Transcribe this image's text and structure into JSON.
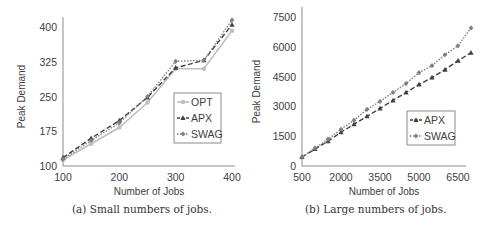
{
  "chart_data": [
    {
      "type": "line",
      "title": "",
      "caption": "(a) Small numbers of jobs.",
      "xlabel": "Number of Jobs",
      "ylabel": "Peak Demand",
      "x": [
        100,
        150,
        200,
        250,
        300,
        350,
        400
      ],
      "xticks": [
        "100",
        "200",
        "300",
        "400"
      ],
      "yticks": [
        "100",
        "175",
        "250",
        "325",
        "400"
      ],
      "xlim": [
        100,
        400
      ],
      "ylim": [
        100,
        400
      ],
      "grid": false,
      "legend_position": "right-center inside",
      "series": [
        {
          "name": "OPT",
          "marker": "circle",
          "style": "solid",
          "color": "#bfbfbf",
          "values": [
            113,
            148,
            183,
            237,
            310,
            310,
            392
          ]
        },
        {
          "name": "APX",
          "marker": "triangle",
          "style": "dashed",
          "color": "#404040",
          "values": [
            118,
            160,
            198,
            248,
            312,
            328,
            405
          ]
        },
        {
          "name": "SWAG",
          "marker": "diamond",
          "style": "dotted",
          "color": "#808080",
          "values": [
            115,
            155,
            193,
            250,
            326,
            328,
            415
          ]
        }
      ]
    },
    {
      "type": "line",
      "title": "",
      "caption": "(b) Large numbers of jobs.",
      "xlabel": "Number of Jobs",
      "ylabel": "Peak Demand",
      "x": [
        500,
        1000,
        1500,
        2000,
        2500,
        3000,
        3500,
        4000,
        4500,
        5000,
        5500,
        6000,
        6500,
        7000
      ],
      "xticks": [
        "500",
        "2000",
        "3500",
        "5000",
        "6500"
      ],
      "yticks": [
        "0",
        "1500",
        "3000",
        "4500",
        "6000",
        "7500"
      ],
      "xlim": [
        500,
        7000
      ],
      "ylim": [
        0,
        7500
      ],
      "grid": false,
      "legend_position": "right-center inside",
      "series": [
        {
          "name": "APX",
          "marker": "triangle",
          "style": "dashed",
          "color": "#404040",
          "values": [
            450,
            850,
            1250,
            1700,
            2100,
            2500,
            2900,
            3300,
            3700,
            4100,
            4450,
            4850,
            5300,
            5700
          ]
        },
        {
          "name": "SWAG",
          "marker": "diamond",
          "style": "dotted",
          "color": "#808080",
          "values": [
            450,
            900,
            1350,
            1850,
            2300,
            2850,
            3250,
            3700,
            4150,
            4700,
            5050,
            5600,
            6050,
            6950
          ]
        }
      ]
    }
  ],
  "captions": {
    "a": "(a) Small numbers of jobs.",
    "b": "(b) Large numbers of jobs."
  }
}
